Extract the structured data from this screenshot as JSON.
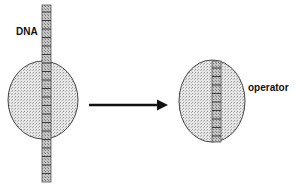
{
  "diagram": {
    "labels": {
      "dna": "DNA",
      "operator": "operator"
    },
    "colors": {
      "stroke": "#333333",
      "blob_fill": "#e2e2e2",
      "strand_fill": "#bdbdbd",
      "band": "#3a3a3a",
      "arrow": "#111111"
    },
    "nodes": [
      {
        "id": "protein-before",
        "kind": "protein-blob",
        "description": "Protein bound to long DNA strand"
      },
      {
        "id": "protein-after",
        "kind": "protein-blob",
        "description": "Protein bound to operator segment"
      }
    ],
    "edges": [
      {
        "from": "protein-before",
        "to": "protein-after",
        "kind": "arrow"
      }
    ]
  }
}
